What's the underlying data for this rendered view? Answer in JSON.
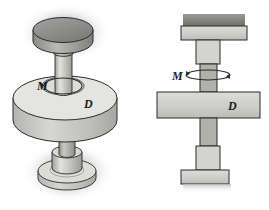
{
  "figure": {
    "name": "shaft-disc-torsion-assembly",
    "background_color": "#ffffff",
    "line_color": "#2b2b2b",
    "views": [
      {
        "id": "isometric",
        "name": "pictorial-isometric-view",
        "labels": [
          {
            "id": "moment",
            "text": "M",
            "x": 40,
            "y": 86
          },
          {
            "id": "diameter",
            "text": "D",
            "x": 88,
            "y": 104
          }
        ]
      },
      {
        "id": "front",
        "name": "front-orthographic-view",
        "labels": [
          {
            "id": "moment",
            "text": "M",
            "x": 176,
            "y": 76
          },
          {
            "id": "diameter",
            "text": "D",
            "x": 232,
            "y": 100
          }
        ]
      }
    ],
    "annotations": {
      "moment_symbol": "M",
      "diameter_symbol": "D",
      "torque_arrow": "curved-rotation-arrow-about-vertical-axis"
    },
    "colors": {
      "cap_dark": "#8e8e8e",
      "cap_dark_edge": "#6f6f6f",
      "body_light": "#d9d9d6",
      "body_mid": "#c3c3c0",
      "body_shade": "#b0b0ad",
      "shaft_light": "#cfcfcc",
      "shaft_dark": "#a9a9a6",
      "outline": "#2b2b2b",
      "shadow": "#cfcfcf"
    }
  }
}
